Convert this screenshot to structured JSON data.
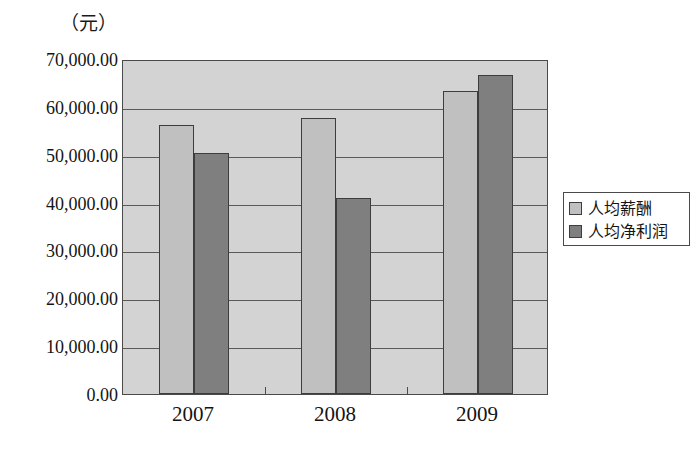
{
  "chart_data": {
    "type": "bar",
    "title": "",
    "subtitle": "",
    "unit_label": "（元）",
    "xlabel": "",
    "ylabel": "",
    "categories": [
      "2007",
      "2008",
      "2009"
    ],
    "series": [
      {
        "name": "人均薪酬",
        "values": [
          56300,
          57700,
          63300
        ],
        "color": "#c0c0c0"
      },
      {
        "name": "人均净利润",
        "values": [
          50300,
          41000,
          66600
        ],
        "color": "#7f7f7f"
      }
    ],
    "ylim": [
      0,
      70000
    ],
    "ytick_values": [
      0,
      10000,
      20000,
      30000,
      40000,
      50000,
      60000,
      70000
    ],
    "ytick_labels": [
      "0.00",
      "10,000.00",
      "20,000.00",
      "30,000.00",
      "40,000.00",
      "50,000.00",
      "60,000.00",
      "70,000.00"
    ],
    "grid": true,
    "legend_position": "right",
    "plot_background": "#d3d3d3",
    "axis_color": "#4a4a4a"
  },
  "legend": {
    "items": [
      {
        "label": "人均薪酬",
        "swatch": "light-gray-swatch"
      },
      {
        "label": "人均净利润",
        "swatch": "dark-gray-swatch"
      }
    ]
  }
}
